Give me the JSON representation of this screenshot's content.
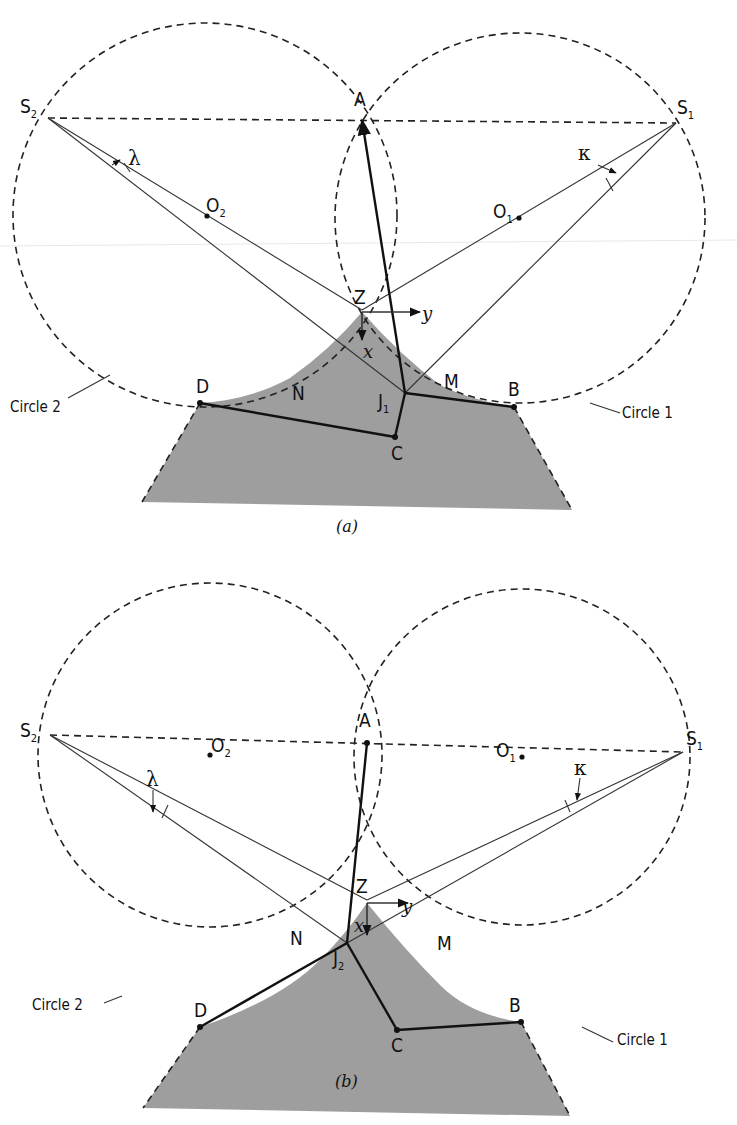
{
  "figure": {
    "panels": [
      {
        "id": "a",
        "caption": "(a)",
        "points": {
          "S1": "S",
          "S1_sub": "1",
          "S2": "S",
          "S2_sub": "2",
          "A": "A",
          "B": "B",
          "C": "C",
          "D": "D",
          "O1": "O",
          "O1_sub": "1",
          "O2": "O",
          "O2_sub": "2",
          "Z": "Z",
          "J": "J",
          "J_sub": "1",
          "M": "M",
          "N": "N"
        },
        "angles": {
          "kappa": "κ",
          "lambda": "λ"
        },
        "axes": {
          "x": "x",
          "y": "y"
        },
        "circles": {
          "circle1": "Circle 1",
          "circle2": "Circle 2"
        }
      },
      {
        "id": "b",
        "caption": "(b)",
        "points": {
          "S1": "S",
          "S1_sub": "1",
          "S2": "S",
          "S2_sub": "2",
          "A": "A",
          "B": "B",
          "C": "C",
          "D": "D",
          "O1": "O",
          "O1_sub": "1",
          "O2": "O",
          "O2_sub": "2",
          "Z": "Z",
          "J": "J",
          "J_sub": "2",
          "M": "M",
          "N": "N"
        },
        "angles": {
          "kappa": "κ",
          "lambda": "λ"
        },
        "axes": {
          "x": "x",
          "y": "y"
        },
        "circles": {
          "circle1": "Circle 1",
          "circle2": "Circle 2"
        }
      }
    ],
    "colors": {
      "shade": "#9e9e9e",
      "ink": "#111111",
      "background": "#ffffff"
    }
  }
}
